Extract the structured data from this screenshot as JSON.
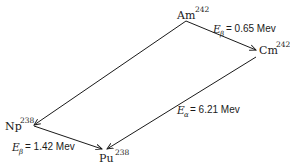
{
  "diagram": {
    "nodes": {
      "am": {
        "symbol": "Am",
        "mass": "242"
      },
      "cm": {
        "symbol": "Cm",
        "mass": "242"
      },
      "np": {
        "symbol": "Np",
        "mass": "238"
      },
      "pu": {
        "symbol": "Pu",
        "mass": "238"
      }
    },
    "transitions": {
      "am_cm": {
        "from": "Am-242",
        "to": "Cm-242",
        "var": "E",
        "sub": "β",
        "eq": "= 0.65 Mev"
      },
      "am_np": {
        "from": "Am-242",
        "to": "Np-238"
      },
      "cm_pu": {
        "from": "Cm-242",
        "to": "Pu-238",
        "var": "E",
        "sub": "α",
        "eq": "= 6.21 Mev"
      },
      "np_pu": {
        "from": "Np-238",
        "to": "Pu-238",
        "var": "E",
        "sub": "β",
        "eq": "= 1.42 Mev"
      }
    }
  }
}
